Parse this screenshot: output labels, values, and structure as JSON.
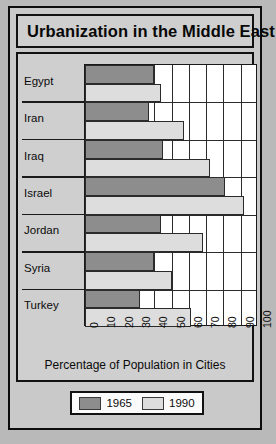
{
  "chart_data": {
    "type": "bar",
    "orientation": "horizontal",
    "title": "Urbanization in the Middle East",
    "xlabel": "Percentage of Population in Cities",
    "ylabel": "",
    "xlim": [
      0,
      100
    ],
    "xticks": [
      "0",
      "10",
      "20",
      "30",
      "40",
      "50",
      "60",
      "70",
      "80",
      "90",
      "100"
    ],
    "grid": true,
    "legend_position": "bottom",
    "categories": [
      "Egypt",
      "Iran",
      "Iraq",
      "Israel",
      "Jordan",
      "Syria",
      "Turkey"
    ],
    "series": [
      {
        "name": "1965",
        "color": "#8d8d8d",
        "values": [
          40,
          37,
          45,
          81,
          44,
          40,
          32
        ]
      },
      {
        "name": "1990",
        "color": "#dddddd",
        "values": [
          44,
          57,
          72,
          92,
          68,
          50,
          61
        ]
      }
    ]
  },
  "legend": {
    "entries": [
      {
        "label": "1965",
        "color": "#8d8d8d"
      },
      {
        "label": "1990",
        "color": "#dddddd"
      }
    ]
  }
}
